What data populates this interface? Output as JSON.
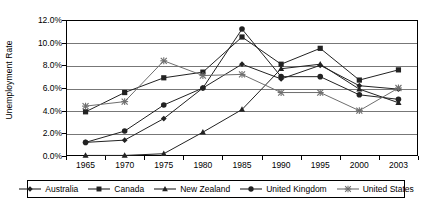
{
  "chart_data": {
    "type": "line",
    "title": "",
    "xlabel": "",
    "ylabel": "Unemployment Rate",
    "categories": [
      "1965",
      "1970",
      "1975",
      "1980",
      "1985",
      "1990",
      "1995",
      "2000",
      "2003"
    ],
    "x": [
      1965,
      1970,
      1975,
      1980,
      1985,
      1990,
      1995,
      2000,
      2003
    ],
    "ylim": [
      0,
      12
    ],
    "ytick_labels": [
      "0.0%",
      "2.0%",
      "4.0%",
      "6.0%",
      "8.0%",
      "10.0%",
      "12.0%"
    ],
    "ytick_values": [
      0,
      2,
      4,
      6,
      8,
      10,
      12
    ],
    "grid": "horizontal",
    "legend_position": "bottom",
    "series": [
      {
        "name": "Australia",
        "marker": "diamond",
        "values": [
          1.2,
          1.4,
          3.3,
          6.0,
          8.1,
          6.8,
          8.0,
          6.2,
          5.9
        ]
      },
      {
        "name": "Canada",
        "marker": "square",
        "values": [
          3.9,
          5.6,
          6.9,
          7.4,
          10.5,
          8.1,
          9.5,
          6.7,
          7.6
        ]
      },
      {
        "name": "New Zealand",
        "marker": "triangle",
        "values": [
          0.05,
          0.05,
          0.2,
          2.1,
          4.1,
          7.7,
          8.1,
          5.9,
          4.7
        ]
      },
      {
        "name": "United Kingdom",
        "marker": "circle",
        "values": [
          1.2,
          2.2,
          4.5,
          6.0,
          11.2,
          7.0,
          7.0,
          5.4,
          5.0
        ]
      },
      {
        "name": "United States",
        "marker": "cross",
        "values": [
          4.4,
          4.8,
          8.4,
          7.1,
          7.2,
          5.6,
          5.6,
          4.0,
          6.0
        ]
      }
    ]
  }
}
